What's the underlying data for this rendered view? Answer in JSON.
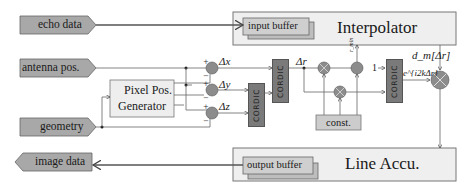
{
  "diagram": {
    "inputs": {
      "echo_data": "echo data",
      "antenna_pos": "antenna pos.",
      "geometry": "geometry"
    },
    "outputs": {
      "image_data": "image data"
    },
    "blocks": {
      "interpolator": "Interpolator",
      "input_buffer": "input buffer",
      "line_accu": "Line Accu.",
      "output_buffer": "output buffer",
      "pixel_pos_generator_line1": "Pixel Pos.",
      "pixel_pos_generator_line2": "Generator",
      "cordic": "CORDIC",
      "const": "const."
    },
    "signals": {
      "dx": "Δx",
      "dy": "Δy",
      "dz": "Δz",
      "dr": "Δr",
      "r_min": "r_min",
      "one": "1",
      "phase": "e^{i2kΔr}",
      "dm": "d_m[Δr]"
    },
    "colors": {
      "port_fill": "#a8a8a8",
      "block_fill": "#eeeeee",
      "buffer_fill": "#c4c4c4",
      "cordic_fill": "#7a7a7a",
      "node_fill": "#8c8c8c",
      "line": "#555555"
    }
  }
}
